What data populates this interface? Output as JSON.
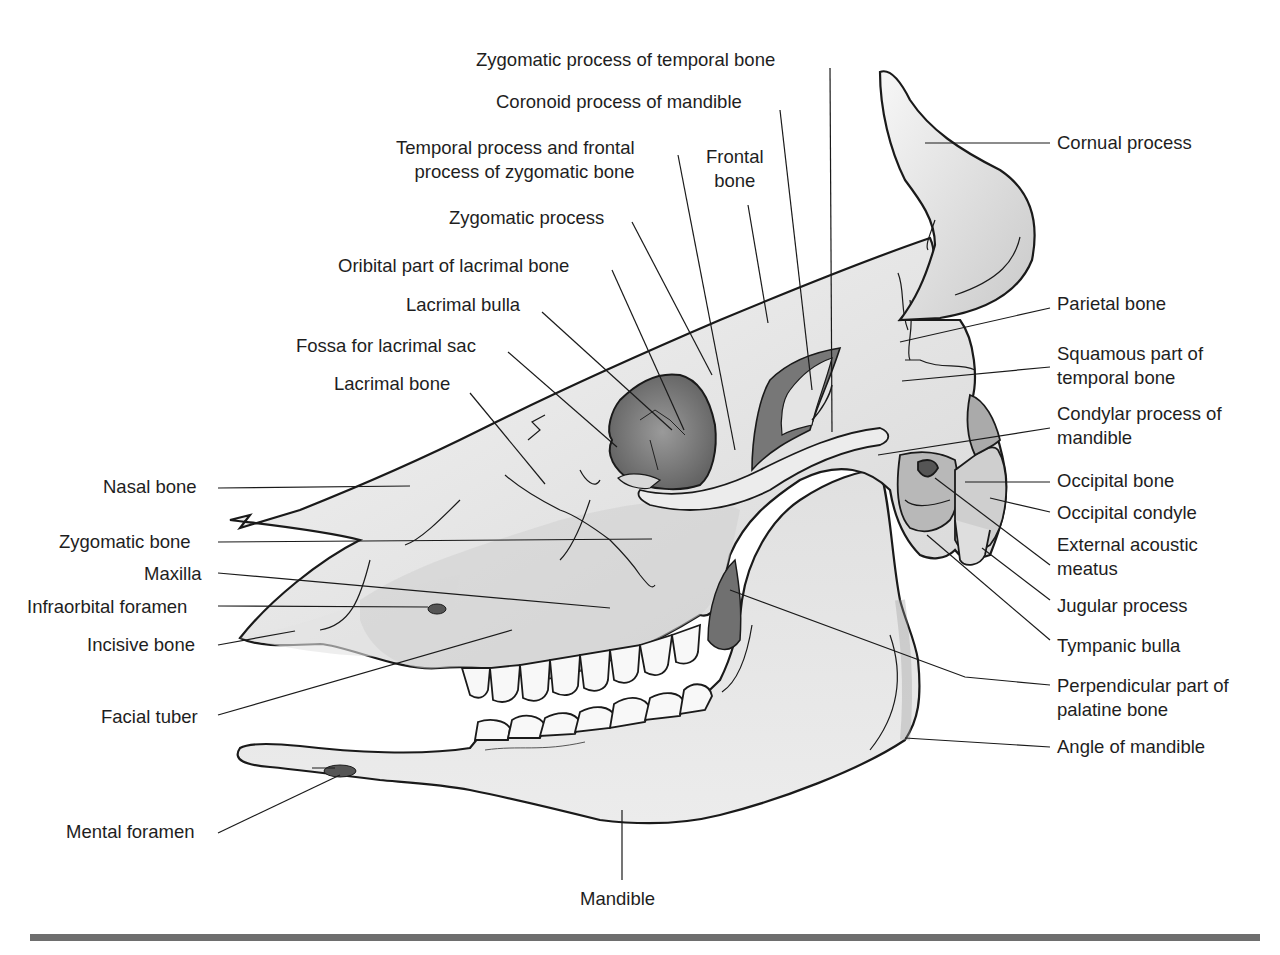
{
  "figure": {
    "colors": {
      "bone_light": "#ededed",
      "bone_mid": "#c8c8c8",
      "bone_dark": "#7a7a7a",
      "outline": "#1a1a1a",
      "rule": "#6e6e6e"
    }
  },
  "labels": {
    "top": {
      "zygomatic_process_temporal": "Zygomatic process of temporal bone",
      "coronoid_process": "Coronoid process of mandible",
      "temporal_frontal_process": "Temporal process and frontal\nprocess of zygomatic bone",
      "frontal_bone": "Frontal\nbone",
      "zygomatic_process": "Zygomatic process",
      "orbital_part_lacrimal": "Oribital part of lacrimal bone",
      "lacrimal_bulla": "Lacrimal bulla",
      "fossa_lacrimal_sac": "Fossa for lacrimal sac",
      "lacrimal_bone": "Lacrimal bone"
    },
    "left": {
      "nasal_bone": "Nasal bone",
      "zygomatic_bone": "Zygomatic bone",
      "maxilla": "Maxilla",
      "infraorbital_foramen": "Infraorbital foramen",
      "incisive_bone": "Incisive bone",
      "facial_tuber": "Facial tuber",
      "mental_foramen": "Mental foramen"
    },
    "right": {
      "cornual_process": "Cornual process",
      "parietal_bone": "Parietal bone",
      "squamous_temporal": "Squamous part of\ntemporal bone",
      "condylar_process": "Condylar process of\nmandible",
      "occipital_bone": "Occipital bone",
      "occipital_condyle": "Occipital condyle",
      "external_acoustic_meatus": "External acoustic\nmeatus",
      "jugular_process": "Jugular process",
      "tympanic_bulla": "Tympanic bulla",
      "perpendicular_palatine": "Perpendicular part of\npalatine bone",
      "angle_mandible": "Angle of mandible"
    },
    "bottom": {
      "mandible": "Mandible"
    }
  }
}
